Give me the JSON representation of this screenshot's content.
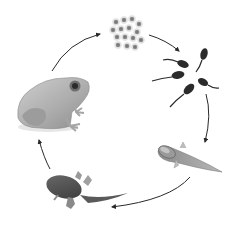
{
  "diagram": {
    "type": "cycle",
    "stages": [
      {
        "id": "eggs",
        "name": "Eggs (frogspawn)",
        "order": 1
      },
      {
        "id": "tadpoles",
        "name": "Tadpoles",
        "order": 2
      },
      {
        "id": "tadpole-with-legs",
        "name": "Tadpole with legs",
        "order": 3
      },
      {
        "id": "froglet",
        "name": "Froglet",
        "order": 4
      },
      {
        "id": "adult-frog",
        "name": "Adult frog",
        "order": 5
      }
    ],
    "arrows": [
      {
        "from": "adult-frog",
        "to": "eggs"
      },
      {
        "from": "eggs",
        "to": "tadpoles"
      },
      {
        "from": "tadpoles",
        "to": "tadpole-with-legs"
      },
      {
        "from": "tadpole-with-legs",
        "to": "froglet"
      },
      {
        "from": "froglet",
        "to": "adult-frog"
      }
    ],
    "colors": {
      "background": "#ffffff",
      "arrow": "#2a2a2a",
      "tadpole": "#2b2b2b",
      "egg": "#8a8a8a",
      "frog": "#b5b5b5"
    }
  }
}
